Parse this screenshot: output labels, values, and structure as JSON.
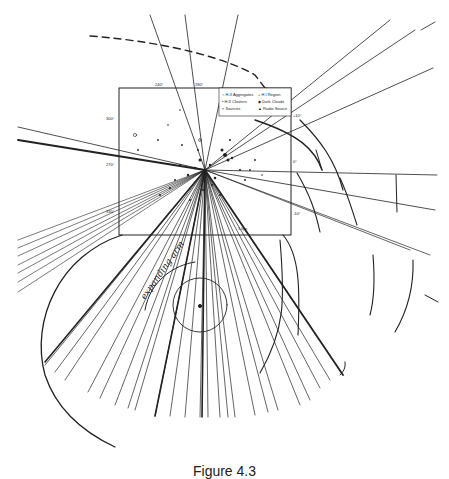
{
  "figure": {
    "caption": "Figure 4.3",
    "inset_box": {
      "top_ticks": [
        "240°",
        "180°"
      ],
      "left_ticks": [
        "300°",
        "270°",
        "330°"
      ],
      "right_ticks": [
        "+10°",
        "0°",
        "-10°"
      ],
      "scale_bar": "1 kpc",
      "legend": [
        {
          "symbol": "○",
          "label": "H-II Aggregates"
        },
        {
          "symbol": "•",
          "label": "H-II Clusters"
        },
        {
          "symbol": "▲",
          "label": "Radio Source"
        },
        {
          "symbol": "+",
          "label": "H I Region"
        },
        {
          "symbol": "◆",
          "label": "Dark Clouds"
        },
        {
          "symbol": "×",
          "label": "Sources"
        }
      ]
    },
    "annotation": "expanding arm",
    "colors": {
      "ink": "#222222",
      "background": "#ffffff"
    }
  }
}
